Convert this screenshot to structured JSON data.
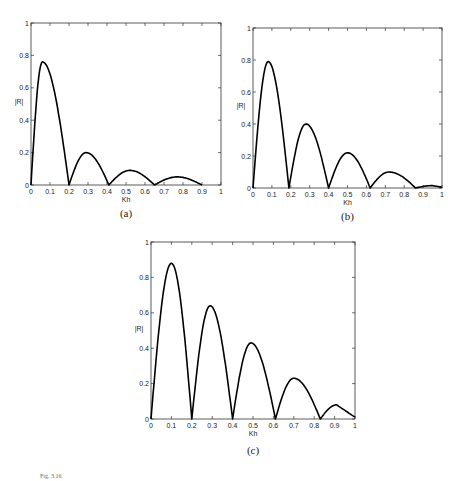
{
  "chart_data": [
    {
      "type": "line",
      "panel": "(a)",
      "title": "",
      "xlabel": "Kh",
      "ylabel": "|R|",
      "xlim": [
        0,
        1
      ],
      "ylim": [
        0,
        1
      ],
      "xticks": [
        "0",
        "0.1",
        "0.2",
        "0.3",
        "0.4",
        "0.5",
        "0.6",
        "0.7",
        "0.8",
        "0.9",
        "1"
      ],
      "yticks": [
        "0",
        "0.2",
        "0.4",
        "0.6",
        "0.8",
        "1"
      ],
      "grid": false,
      "series": [
        {
          "name": "|R|",
          "peaks": [
            [
              0.06,
              0.76
            ],
            [
              0.29,
              0.2
            ],
            [
              0.52,
              0.09
            ],
            [
              0.77,
              0.05
            ]
          ],
          "zeros": [
            0.0,
            0.2,
            0.41,
            0.65,
            0.9
          ],
          "end": [
            1.0,
            0.03
          ]
        }
      ]
    },
    {
      "type": "line",
      "panel": "(b)",
      "title": "",
      "xlabel": "Kh",
      "ylabel": "|R|",
      "xlim": [
        0,
        1
      ],
      "ylim": [
        0,
        1
      ],
      "xticks": [
        "0",
        "0.1",
        "0.2",
        "0.3",
        "0.4",
        "0.5",
        "0.6",
        "0.7",
        "0.8",
        "0.9",
        "1"
      ],
      "yticks": [
        "0",
        "0.2",
        "0.4",
        "0.6",
        "0.8",
        "1"
      ],
      "grid": false,
      "series": [
        {
          "name": "|R|",
          "peaks": [
            [
              0.08,
              0.79
            ],
            [
              0.28,
              0.4
            ],
            [
              0.5,
              0.22
            ],
            [
              0.72,
              0.1
            ],
            [
              0.95,
              0.015
            ]
          ],
          "zeros": [
            0.0,
            0.19,
            0.4,
            0.62,
            0.86
          ],
          "end": [
            1.0,
            0.005
          ]
        }
      ]
    },
    {
      "type": "line",
      "panel": "(c)",
      "title": "",
      "xlabel": "Kh",
      "ylabel": "|R|",
      "xlim": [
        0,
        1
      ],
      "ylim": [
        0,
        1
      ],
      "xticks": [
        "0",
        "0.1",
        "0.2",
        "0.3",
        "0.4",
        "0.5",
        "0.6",
        "0.7",
        "0.8",
        "0.9",
        "1"
      ],
      "yticks": [
        "0",
        "0.2",
        "0.4",
        "0.6",
        "0.8",
        "1"
      ],
      "grid": false,
      "series": [
        {
          "name": "|R|",
          "peaks": [
            [
              0.1,
              0.88
            ],
            [
              0.29,
              0.64
            ],
            [
              0.49,
              0.43
            ],
            [
              0.7,
              0.23
            ],
            [
              0.91,
              0.08
            ]
          ],
          "zeros": [
            0.0,
            0.2,
            0.4,
            0.61,
            0.83
          ],
          "end": [
            1.0,
            0.01
          ]
        }
      ]
    }
  ],
  "panels": [
    {
      "caption": "(a)",
      "box": [
        31,
        23,
        221,
        185
      ]
    },
    {
      "caption": "(b)",
      "box": [
        253,
        28,
        442,
        188
      ]
    },
    {
      "caption": "(c)",
      "box": [
        151,
        242,
        355,
        419
      ]
    }
  ],
  "footer": "Fig. 3.16"
}
